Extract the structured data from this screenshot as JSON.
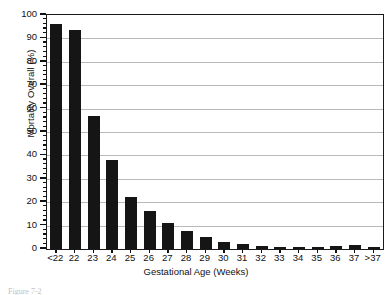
{
  "chart_data": {
    "type": "bar",
    "title": "",
    "xlabel": "Gestational Age (Weeks)",
    "ylabel": "Mortality Overall (%)",
    "categories": [
      "<22",
      "22",
      "23",
      "24",
      "25",
      "26",
      "27",
      "28",
      "29",
      "30",
      "31",
      "32",
      "33",
      "34",
      "35",
      "36",
      "37",
      ">37"
    ],
    "values": [
      96,
      93.5,
      57,
      38,
      22.3,
      16.3,
      11,
      7.6,
      5,
      3,
      2.3,
      1.5,
      0.7,
      0.7,
      0.7,
      1.2,
      1.6,
      0.7
    ],
    "ylim": [
      0,
      100
    ],
    "xlim_note": "18 categorical slots",
    "ytick_labels": [
      "0",
      "10",
      "20",
      "30",
      "40",
      "50",
      "60",
      "70",
      "80",
      "90",
      "100"
    ],
    "ytick_values": [
      0,
      10,
      20,
      30,
      40,
      50,
      60,
      70,
      80,
      90,
      100
    ],
    "yminor_step": 2,
    "grid": "horizontal",
    "legend": "none",
    "bar_color": "#151515",
    "grid_color": "#b9b9b9",
    "axis_color": "#1a1a1a"
  },
  "figure": {
    "caption_partial": "Figure 7-2"
  }
}
